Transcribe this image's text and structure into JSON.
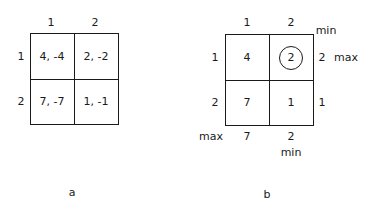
{
  "panel_a": {
    "caption": "a",
    "column_headers": [
      "1",
      "2"
    ],
    "row_headers": [
      "1",
      "2"
    ],
    "cells": [
      [
        "4, -4",
        "2, -2"
      ],
      [
        "7, -7",
        "1, -1"
      ]
    ]
  },
  "panel_b": {
    "caption": "b",
    "column_headers": [
      "1",
      "2"
    ],
    "row_headers": [
      "1",
      "2"
    ],
    "cells": [
      [
        "4",
        "2"
      ],
      [
        "7",
        "1"
      ]
    ],
    "circled_cell": "2",
    "row_minima": [
      "2",
      "1"
    ],
    "row_minima_label": "min",
    "row_max_label": "max",
    "column_maxima": [
      "7",
      "2"
    ],
    "column_maxima_label": "max",
    "column_min_label": "min"
  }
}
